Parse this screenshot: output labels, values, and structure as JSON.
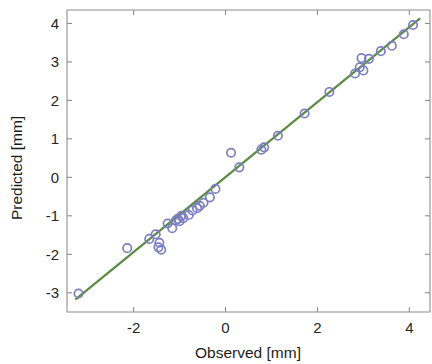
{
  "chart_data": {
    "type": "scatter",
    "title": "",
    "xlabel": "Observed [mm]",
    "ylabel": "Predicted [mm]",
    "xlim": [
      -3.45,
      4.45
    ],
    "ylim": [
      -3.5,
      4.35
    ],
    "xticks": [
      -2,
      0,
      2,
      4
    ],
    "xticklabels": [
      "-2",
      "0",
      "2",
      "4"
    ],
    "yticks": [
      -3,
      -2,
      -1,
      0,
      1,
      2,
      3,
      4
    ],
    "yticklabels": [
      "-3",
      "-2",
      "-1",
      "0",
      "1",
      "2",
      "3",
      "4"
    ],
    "grid": false,
    "legend": null,
    "marker": "open-circle",
    "marker_color": "#7b7fc2",
    "line_color": "#5d8c46",
    "series": [
      {
        "name": "Observed vs Predicted",
        "type": "scatter",
        "points": [
          [
            -3.2,
            -3.02
          ],
          [
            -2.14,
            -1.84
          ],
          [
            -1.66,
            -1.6
          ],
          [
            -1.52,
            -1.48
          ],
          [
            -1.46,
            -1.82
          ],
          [
            -1.44,
            -1.7
          ],
          [
            -1.4,
            -1.88
          ],
          [
            -1.26,
            -1.2
          ],
          [
            -1.16,
            -1.32
          ],
          [
            -1.08,
            -1.12
          ],
          [
            -1.04,
            -1.08
          ],
          [
            -1.0,
            -1.14
          ],
          [
            -0.96,
            -1.0
          ],
          [
            -0.92,
            -1.06
          ],
          [
            -0.8,
            -0.98
          ],
          [
            -0.72,
            -0.86
          ],
          [
            -0.62,
            -0.8
          ],
          [
            -0.56,
            -0.74
          ],
          [
            -0.48,
            -0.66
          ],
          [
            -0.34,
            -0.52
          ],
          [
            -0.22,
            -0.3
          ],
          [
            0.12,
            0.64
          ],
          [
            0.3,
            0.26
          ],
          [
            0.78,
            0.72
          ],
          [
            0.84,
            0.78
          ],
          [
            1.14,
            1.08
          ],
          [
            1.72,
            1.66
          ],
          [
            2.26,
            2.22
          ],
          [
            2.82,
            2.7
          ],
          [
            2.92,
            2.86
          ],
          [
            2.96,
            3.1
          ],
          [
            3.0,
            2.78
          ],
          [
            3.12,
            3.08
          ],
          [
            3.38,
            3.28
          ],
          [
            3.62,
            3.42
          ],
          [
            3.88,
            3.72
          ],
          [
            4.08,
            3.96
          ]
        ]
      },
      {
        "name": "identity-line",
        "type": "line",
        "x": [
          -3.25,
          4.22
        ],
        "y": [
          -3.16,
          4.12
        ]
      }
    ]
  }
}
